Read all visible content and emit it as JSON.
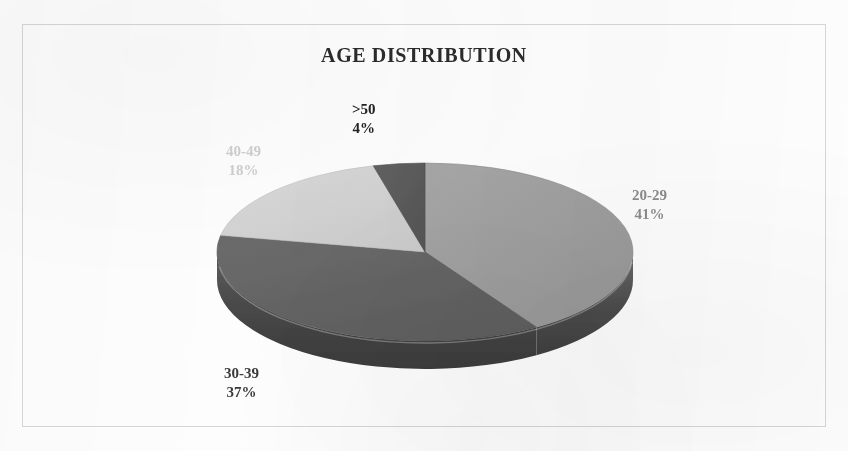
{
  "chart_data": {
    "type": "pie",
    "title": "AGE DISTRIBUTION",
    "xlabel": "",
    "ylabel": "",
    "legend_position": "none",
    "grid": false,
    "three_d": true,
    "start_angle_deg": 0,
    "direction": "clockwise",
    "categories": [
      "20-29",
      "30-39",
      "40-49",
      ">50"
    ],
    "values": [
      41,
      37,
      18,
      4
    ],
    "value_unit": "%",
    "slices": [
      {
        "label": "20-29",
        "value": 41,
        "value_text": "41%",
        "top_color": "#9e9e9e",
        "side_color": "#4f4f4f",
        "label_color": "#8c8c8c"
      },
      {
        "label": "30-39",
        "value": 37,
        "value_text": "37%",
        "top_color": "#636363",
        "side_color": "#474747",
        "label_color": "#3a3a3a"
      },
      {
        "label": "40-49",
        "value": 18,
        "value_text": "18%",
        "top_color": "#d2d2d2",
        "side_color": "#8f8f8f",
        "label_color": "#cfcfcf"
      },
      {
        "label": ">50",
        "value": 4,
        "value_text": "4%",
        "top_color": "#5a5a5a",
        "side_color": "#3e3e3e",
        "label_color": "#222222"
      }
    ]
  },
  "labels": {
    "s2029": {
      "name": "20-29",
      "value": "41%"
    },
    "s3039": {
      "name": "30-39",
      "value": "37%"
    },
    "s4049": {
      "name": "40-49",
      "value": "18%"
    },
    "s50": {
      "name": ">50",
      "value": "4%"
    }
  },
  "frame": {
    "border_color": "#d6d6d8",
    "background": "#fdfdfd"
  }
}
